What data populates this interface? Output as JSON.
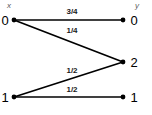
{
  "diagram": {
    "type": "channel-transition-diagram",
    "background_color": "#ffffff",
    "line_color": "#000000",
    "columns": [
      {
        "id": "input",
        "header": "x",
        "header_x": 9,
        "header_y": 6
      },
      {
        "id": "output",
        "header": "y",
        "header_x": 137,
        "header_y": 6
      }
    ],
    "nodes": [
      {
        "id": "x0",
        "label": "0",
        "column": "input",
        "x": 14,
        "y": 20,
        "label_x": 5,
        "label_y": 20
      },
      {
        "id": "x1",
        "label": "1",
        "column": "input",
        "x": 14,
        "y": 97,
        "label_x": 5,
        "label_y": 97
      },
      {
        "id": "y0",
        "label": "0",
        "column": "output",
        "x": 123,
        "y": 20,
        "label_x": 134,
        "label_y": 20
      },
      {
        "id": "y2",
        "label": "2",
        "column": "output",
        "x": 123,
        "y": 62,
        "label_x": 134,
        "label_y": 62
      },
      {
        "id": "y1",
        "label": "1",
        "column": "output",
        "x": 123,
        "y": 97,
        "label_x": 134,
        "label_y": 97
      }
    ],
    "edges": [
      {
        "id": "e-x0-y0",
        "from": "x0",
        "to": "y0",
        "label": "3/4",
        "x1": 14,
        "y1": 20,
        "x2": 123,
        "y2": 20,
        "label_x": 72,
        "label_y": 12
      },
      {
        "id": "e-x0-y2",
        "from": "x0",
        "to": "y2",
        "label": "1/4",
        "x1": 14,
        "y1": 20,
        "x2": 123,
        "y2": 62,
        "label_x": 72,
        "label_y": 31
      },
      {
        "id": "e-x1-y2",
        "from": "x1",
        "to": "y2",
        "label": "1/2",
        "x1": 14,
        "y1": 97,
        "x2": 123,
        "y2": 62,
        "label_x": 72,
        "label_y": 71
      },
      {
        "id": "e-x1-y1",
        "from": "x1",
        "to": "y1",
        "label": "1/2",
        "x1": 14,
        "y1": 97,
        "x2": 123,
        "y2": 97,
        "label_x": 72,
        "label_y": 90
      }
    ]
  }
}
